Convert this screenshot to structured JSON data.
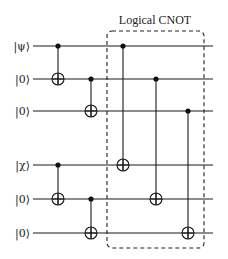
{
  "title": "Logical CNOT",
  "qubits": [
    {
      "label": "|ψ⟩",
      "y": 46
    },
    {
      "label": "|0⟩",
      "y": 79
    },
    {
      "label": "|0⟩",
      "y": 111
    },
    {
      "label": "|χ⟩",
      "y": 165
    },
    {
      "label": "|0⟩",
      "y": 199
    },
    {
      "label": "|0⟩",
      "y": 233
    }
  ],
  "wire_x": [
    33,
    213
  ],
  "gates": [
    {
      "type": "cnot",
      "x": 58,
      "control": 0,
      "target": 1
    },
    {
      "type": "cnot",
      "x": 91,
      "control": 1,
      "target": 2
    },
    {
      "type": "cnot",
      "x": 58,
      "control": 3,
      "target": 4
    },
    {
      "type": "cnot",
      "x": 91,
      "control": 4,
      "target": 5
    },
    {
      "type": "cnot",
      "x": 123,
      "control": 0,
      "target": 3
    },
    {
      "type": "cnot",
      "x": 156,
      "control": 1,
      "target": 4
    },
    {
      "type": "cnot",
      "x": 188,
      "control": 2,
      "target": 5
    }
  ],
  "box": {
    "x": 107,
    "y": 31,
    "width": 97,
    "height": 217,
    "radius": 5
  },
  "colors": {
    "line": "#1a1a1a",
    "background": "#ffffff"
  }
}
